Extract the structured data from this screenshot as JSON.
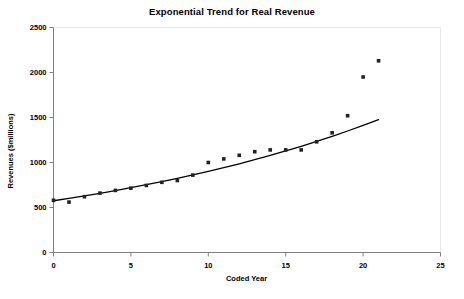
{
  "chart_data": {
    "type": "scatter",
    "title": "Exponential Trend for Real Revenue",
    "xlabel": "Coded Year",
    "ylabel": "Revenues ($millions)",
    "xlim": [
      0,
      25
    ],
    "ylim": [
      0,
      2500
    ],
    "xticks": [
      0,
      5,
      10,
      15,
      20,
      25
    ],
    "yticks": [
      0,
      500,
      1000,
      1500,
      2000,
      2500
    ],
    "grid": false,
    "legend": null,
    "marker_color": "#222222",
    "trendline_color": "#000000",
    "axis_color": "#808080",
    "series": [
      {
        "name": "Real Revenue",
        "type": "scatter",
        "x": [
          0,
          1,
          2,
          3,
          4,
          5,
          6,
          7,
          8,
          9,
          10,
          11,
          12,
          13,
          14,
          15,
          16,
          17,
          18,
          19,
          20,
          21
        ],
        "values": [
          580,
          560,
          620,
          660,
          690,
          715,
          745,
          780,
          800,
          860,
          1000,
          1040,
          1080,
          1120,
          1140,
          1140,
          1140,
          1230,
          1330,
          1520,
          1950,
          2130
        ]
      },
      {
        "name": "Exponential Trend",
        "type": "line",
        "x": [
          0,
          1,
          2,
          3,
          4,
          5,
          6,
          7,
          8,
          9,
          10,
          11,
          12,
          13,
          14,
          15,
          16,
          17,
          18,
          19,
          20,
          21
        ],
        "values": [
          575,
          601,
          629,
          658,
          688,
          720,
          753,
          788,
          824,
          862,
          901,
          943,
          986,
          1031,
          1079,
          1128,
          1180,
          1234,
          1291,
          1350,
          1412,
          1477
        ]
      }
    ]
  }
}
